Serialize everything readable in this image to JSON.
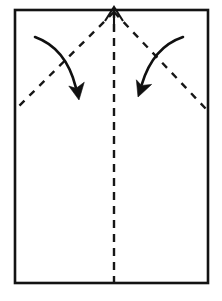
{
  "figure": {
    "kind": "origami-fold-diagram",
    "canvas": {
      "width": 222,
      "height": 301
    },
    "background_color": "#ffffff",
    "ink_color": "#131313"
  },
  "paper": {
    "label": "paper sheet",
    "shape": "rectangle",
    "fill_color": "#ffffff",
    "stroke_color": "#131313",
    "stroke_width": 2.6,
    "left": 15,
    "top": 10,
    "right": 208,
    "bottom": 283,
    "width": 193,
    "height": 273
  },
  "creases": [
    {
      "name": "center-vertical-crease",
      "style": "dashed",
      "dash": "8 6",
      "stroke_color": "#161616",
      "x1": 114,
      "y1": 10,
      "x2": 114,
      "y2": 283
    },
    {
      "name": "left-diagonal-crease",
      "style": "dashed",
      "dash": "7 7",
      "stroke_color": "#161616",
      "x1": 114,
      "y1": 12,
      "x2": 16,
      "y2": 109
    },
    {
      "name": "right-diagonal-crease",
      "style": "dashed",
      "dash": "7 7",
      "stroke_color": "#161616",
      "x1": 114,
      "y1": 12,
      "x2": 207,
      "y2": 110
    }
  ],
  "arrows": [
    {
      "name": "pull-up-arrow",
      "direction": "up",
      "style": "open-head-straight",
      "stroke_color": "#131313",
      "tail_x": 114,
      "tail_y": 30,
      "tip_x": 114,
      "tip_y": 7,
      "head_half_width": 9,
      "head_length": 14
    },
    {
      "name": "left-fold-arrow",
      "direction": "down-right",
      "style": "solid-head-curved",
      "stroke_color": "#101010",
      "tail_x": 35,
      "tail_y": 37,
      "tip_x": 79,
      "tip_y": 100,
      "curve_control_x": 66,
      "curve_control_y": 48
    },
    {
      "name": "right-fold-arrow",
      "direction": "down-left",
      "style": "solid-head-curved",
      "stroke_color": "#101010",
      "tail_x": 183,
      "tail_y": 37,
      "tip_x": 138,
      "tip_y": 97,
      "curve_control_x": 153,
      "curve_control_y": 47
    }
  ]
}
